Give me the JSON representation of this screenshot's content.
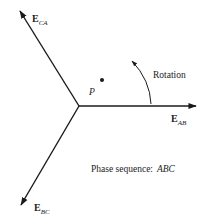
{
  "diagram": {
    "phasors": [
      {
        "name": "E",
        "subscript": "AB",
        "angle_deg": 0
      },
      {
        "name": "E",
        "subscript": "BC",
        "angle_deg": -120
      },
      {
        "name": "E",
        "subscript": "CA",
        "angle_deg": 120
      }
    ],
    "point_label": "P",
    "rotation_label": "Rotation",
    "phase_sequence_label": "Phase sequence:",
    "phase_sequence_value": "ABC",
    "colors": {
      "stroke": "#1a1a1a",
      "text": "#222222"
    }
  }
}
